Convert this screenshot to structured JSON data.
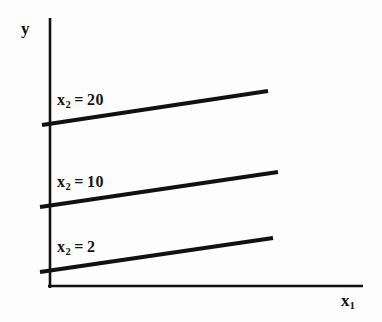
{
  "figure": {
    "background_color": "#fdfdfd",
    "ink_color": "#111111"
  },
  "axes": {
    "y_label": "y",
    "x_label_base": "x",
    "x_label_sub": "1",
    "y_axis": {
      "x": 50,
      "y_top": 18,
      "y_bottom": 288
    },
    "x_axis": {
      "y": 286,
      "x_left": 48,
      "x_right": 363
    }
  },
  "chart_data": {
    "type": "line",
    "title": "",
    "xlabel": "x1",
    "ylabel": "y",
    "grid": false,
    "legend": "inline-annotations",
    "axis_style": "schematic-no-ticks",
    "series": [
      {
        "name": "x2 = 20",
        "label_base": "x",
        "label_sub": "2",
        "label_eq": "=",
        "label_value": "20",
        "x2_value": 20,
        "line": {
          "x1": 42,
          "y1": 125,
          "x2": 268,
          "y2": 91
        },
        "label_position": {
          "x": 57,
          "y": 92
        }
      },
      {
        "name": "x2 = 10",
        "label_base": "x",
        "label_sub": "2",
        "label_eq": "=",
        "label_value": "10",
        "x2_value": 10,
        "line": {
          "x1": 40,
          "y1": 207,
          "x2": 278,
          "y2": 172
        },
        "label_position": {
          "x": 57,
          "y": 174
        }
      },
      {
        "name": "x2 = 2",
        "label_base": "x",
        "label_sub": "2",
        "label_eq": "=",
        "label_value": "2",
        "x2_value": 2,
        "line": {
          "x1": 40,
          "y1": 272,
          "x2": 273,
          "y2": 238
        },
        "label_position": {
          "x": 57,
          "y": 239
        }
      }
    ]
  }
}
